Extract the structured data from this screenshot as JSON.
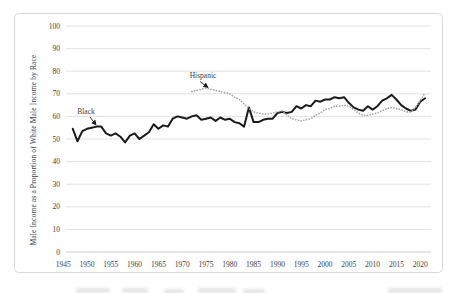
{
  "chart_data": {
    "type": "line",
    "title": "",
    "xlabel": "",
    "ylabel": "Male Income as a Proportion of White Male Income by Race",
    "xlim": [
      1945,
      2022
    ],
    "ylim": [
      0,
      100
    ],
    "grid": true,
    "legend_position": "none",
    "x_ticks": [
      1945,
      1950,
      1955,
      1960,
      1965,
      1970,
      1975,
      1980,
      1985,
      1990,
      1995,
      2000,
      2005,
      2010,
      2015,
      2020
    ],
    "y_ticks": [
      0,
      10,
      20,
      30,
      40,
      50,
      60,
      70,
      80,
      90,
      100
    ],
    "series": [
      {
        "name": "Black",
        "style": "solid",
        "color": "#1a1a1a",
        "start_year": 1947,
        "values": [
          54.5,
          49,
          53.5,
          54.5,
          55,
          55.5,
          55.5,
          52.5,
          51.5,
          52.5,
          51,
          48.5,
          51.5,
          52.5,
          50,
          51.5,
          53,
          56.5,
          54.5,
          56,
          55.5,
          59,
          60,
          59.5,
          59,
          60,
          60.5,
          58.5,
          59,
          59.5,
          58,
          59.5,
          58.5,
          59,
          57.5,
          57,
          55.5,
          64,
          57.5,
          57.5,
          58.5,
          59,
          59,
          61.5,
          62,
          61.5,
          62,
          64.5,
          63.5,
          65,
          64.5,
          67,
          66.5,
          67.5,
          67.5,
          68.5,
          68,
          68.5,
          66,
          64,
          63,
          62.5,
          64.5,
          63,
          64.5,
          67,
          68,
          69.5,
          67.5,
          65,
          63.5,
          62.5,
          63,
          66.5,
          68
        ]
      },
      {
        "name": "Hispanic",
        "style": "dotted",
        "color": "#a6a6a6",
        "start_year": 1972,
        "values": [
          71,
          71.5,
          72,
          72.5,
          72,
          71.5,
          71,
          70.5,
          70,
          68.5,
          67.5,
          65.5,
          63.5,
          62,
          61.5,
          61,
          61,
          61.5,
          62,
          62.5,
          60.5,
          59,
          58.5,
          58,
          58.5,
          59,
          60.5,
          61.5,
          63,
          63.5,
          64.5,
          64.5,
          65,
          64.5,
          63,
          61.5,
          60.5,
          60.5,
          61,
          61.5,
          62.5,
          63.5,
          64,
          63.5,
          63,
          62,
          62,
          64,
          67,
          70.5
        ]
      }
    ],
    "annotations": [
      {
        "label": "Black",
        "text_x": 86,
        "text_y": 114,
        "arrow": [
          90,
          117,
          96,
          125
        ]
      },
      {
        "label": "Hispanic",
        "text_x": 203,
        "text_y": 78,
        "arrow": [
          200,
          81.5,
          208,
          87.5
        ]
      }
    ],
    "colors": {
      "gridline": "#d9d9d9",
      "axis_line": "#bfbfbf",
      "tick_text": "#404040",
      "frame_border": "#d9d9d9",
      "annotation_text": "#1a1a1a"
    }
  }
}
